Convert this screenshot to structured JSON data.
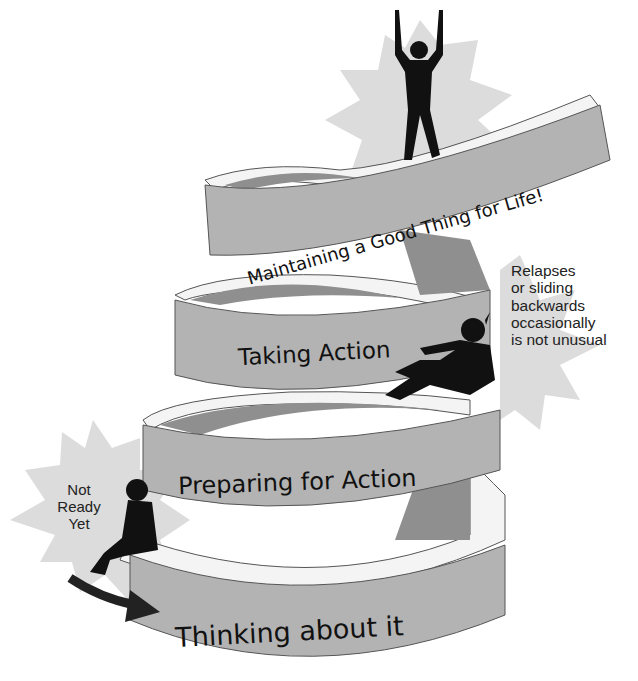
{
  "diagram": {
    "type": "stages-of-change spiral staircase",
    "colors": {
      "ribbon_face": "#b3b3b3",
      "ribbon_top": "#f4f4f4",
      "ribbon_inner": "#8f8f8f",
      "ribbon_edge": "#555555",
      "starburst": "#dcdcdc",
      "silhouette": "#111111",
      "background": "#ffffff"
    },
    "stages": [
      {
        "id": "thinking",
        "label": "Thinking about it",
        "level": 1
      },
      {
        "id": "preparing",
        "label": "Preparing for Action",
        "level": 2
      },
      {
        "id": "taking",
        "label": "Taking Action",
        "level": 3
      },
      {
        "id": "maintaining",
        "label": "Maintaining a Good Thing for Life!",
        "level": 4
      }
    ],
    "notes": {
      "not_ready": [
        "Not",
        "Ready",
        "Yet"
      ],
      "relapse": [
        "Relapses",
        "or sliding",
        "backwards",
        "occasionally",
        "is not unusual"
      ]
    },
    "figures": [
      {
        "id": "sitting-figure",
        "description": "person sitting at base"
      },
      {
        "id": "sliding-figure",
        "description": "person sliding backwards"
      },
      {
        "id": "celebrating-figure",
        "description": "person with raised arms at top"
      }
    ],
    "arrow": {
      "id": "entry-arrow",
      "direction": "right"
    }
  }
}
